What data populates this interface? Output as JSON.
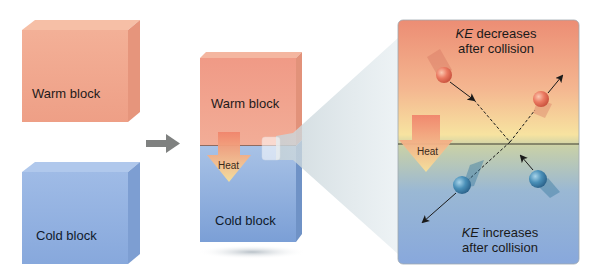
{
  "diagram": {
    "left": {
      "warm_block_label": "Warm block",
      "cold_block_label": "Cold block"
    },
    "arrow": "right-arrow",
    "middle": {
      "warm_block_label": "Warm block",
      "cold_block_label": "Cold block",
      "heat_label": "Heat"
    },
    "zoom_panel": {
      "top_text_em": "KE",
      "top_text_rest": " decreases",
      "top_text_line2": "after collision",
      "bottom_text_em": "KE",
      "bottom_text_rest": " increases",
      "bottom_text_line2": "after collision",
      "heat_label": "Heat"
    },
    "colors": {
      "warm": "#f0a58c",
      "cold": "#8fb0e0",
      "warm_particle": "#e8705c",
      "cold_particle": "#4a8ab0",
      "heat_arrow_top": "#f08870",
      "heat_arrow_bottom": "#f5d890",
      "arrow_gray": "#7f8180"
    }
  }
}
